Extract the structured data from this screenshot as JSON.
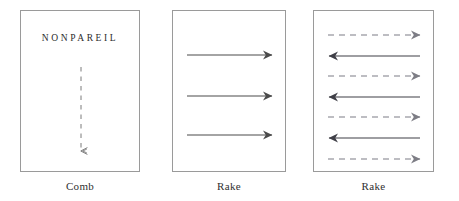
{
  "figure": {
    "background_color": "#ffffff",
    "stroke_color": "#4a4a4a",
    "border_color": "#9a9a9a",
    "text_color": "#2b2b2b",
    "panels": [
      {
        "id": "comb",
        "caption": "Comb",
        "heading": "NONPAREIL",
        "arrows": [
          {
            "direction": "down",
            "style": "dashed",
            "x1": 60,
            "y1": 56,
            "x2": 60,
            "y2": 142
          }
        ]
      },
      {
        "id": "rake-1",
        "caption": "Rake",
        "heading": "",
        "arrows": [
          {
            "direction": "right",
            "style": "solid",
            "x1": 14,
            "y1": 44,
            "x2": 100,
            "y2": 44
          },
          {
            "direction": "right",
            "style": "solid",
            "x1": 14,
            "y1": 85,
            "x2": 100,
            "y2": 85
          },
          {
            "direction": "right",
            "style": "solid",
            "x1": 14,
            "y1": 124,
            "x2": 100,
            "y2": 124
          }
        ]
      },
      {
        "id": "rake-2",
        "caption": "Rake",
        "heading": "",
        "arrows": [
          {
            "direction": "right",
            "style": "dashed",
            "x1": 14,
            "y1": 24,
            "x2": 107,
            "y2": 24
          },
          {
            "direction": "left",
            "style": "solid",
            "x1": 107,
            "y1": 45,
            "x2": 14,
            "y2": 45
          },
          {
            "direction": "right",
            "style": "dashed",
            "x1": 14,
            "y1": 65,
            "x2": 107,
            "y2": 65
          },
          {
            "direction": "left",
            "style": "solid",
            "x1": 107,
            "y1": 86,
            "x2": 14,
            "y2": 86
          },
          {
            "direction": "right",
            "style": "dashed",
            "x1": 14,
            "y1": 106,
            "x2": 107,
            "y2": 106
          },
          {
            "direction": "left",
            "style": "solid",
            "x1": 107,
            "y1": 127,
            "x2": 14,
            "y2": 127
          },
          {
            "direction": "right",
            "style": "dashed",
            "x1": 14,
            "y1": 148,
            "x2": 107,
            "y2": 148
          }
        ]
      }
    ]
  }
}
